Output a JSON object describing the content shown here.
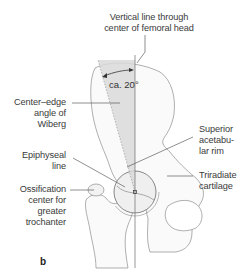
{
  "figure": {
    "panel_letter": "b",
    "angle_value_label": "ca. 20°",
    "labels": {
      "vertical_line": [
        "Vertical line through",
        "center of femoral head"
      ],
      "center_edge_angle": [
        "Center–edge",
        "angle of",
        "Wiberg"
      ],
      "epiphyseal_line": [
        "Epiphyseal",
        "line"
      ],
      "ossification_center": [
        "Ossification",
        "center for",
        "greater",
        "trochanter"
      ],
      "superior_rim": [
        "Superior",
        "acetabu-",
        "lar rim"
      ],
      "triradiate": [
        "Triradiate",
        "cartilage"
      ]
    },
    "colors": {
      "line": "#6b6b6b",
      "leader": "#444444",
      "angle_fill": "#d9d9d9",
      "bone_fill": "#f4f4f4",
      "text": "#3a3a3a"
    }
  }
}
